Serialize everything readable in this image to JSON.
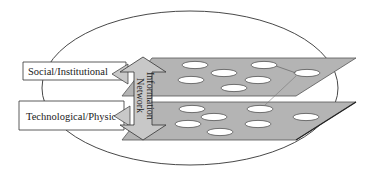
{
  "diagram": {
    "type": "layered-network-diagram",
    "labels": {
      "social": "Social/Institutional",
      "technological": "Technological/Physic",
      "arrow_line1": "Information",
      "arrow_line2": "Network"
    },
    "colors": {
      "plane_fill": "#b4b4b4",
      "plane_stroke": "#555555",
      "arrow_fill": "#c8c8c8",
      "node_fill": "#ffffff",
      "outline": "#333333"
    },
    "layers": [
      {
        "name": "Social/Institutional",
        "node_count": 8
      },
      {
        "name": "Technological/Physic",
        "node_count": 8
      }
    ]
  }
}
